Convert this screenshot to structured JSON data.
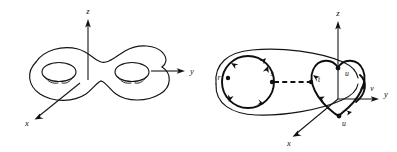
{
  "figure": {
    "background_color": "#ffffff",
    "ink_color": "#111111",
    "panels": [
      {
        "id": "left-panel",
        "name": "double-torus-diagram",
        "shape": "genus-2 surface (double torus)",
        "axes": [
          {
            "id": "z",
            "label": "z",
            "direction": "up",
            "label_x": 88,
            "label_y": 14
          },
          {
            "id": "y",
            "label": "y",
            "direction": "right",
            "label_x": 192,
            "label_y": 71
          },
          {
            "id": "x",
            "label": "x",
            "direction": "down-left",
            "label_x": 27,
            "label_y": 124
          }
        ],
        "holes": 2,
        "curve_labels": []
      },
      {
        "id": "right-panel",
        "name": "handle-diagram",
        "shape": "curved tube / handle with pinched right cross-section",
        "axes": [
          {
            "id": "z",
            "label": "z",
            "direction": "up",
            "label_x": 338,
            "label_y": 16
          },
          {
            "id": "y",
            "label": "y",
            "direction": "right",
            "label_x": 386,
            "label_y": 94
          },
          {
            "id": "x",
            "label": "x",
            "direction": "down-left",
            "label_x": 289,
            "label_y": 143
          }
        ],
        "curve_labels": [
          {
            "id": "r",
            "label": "r",
            "x": 221,
            "y": 78,
            "description": "left circular cross-section point"
          },
          {
            "id": "s",
            "label": "s",
            "x": 272,
            "y": 74,
            "description": "left end of dashed core segment"
          },
          {
            "id": "t",
            "label": "t",
            "x": 318,
            "y": 79,
            "description": "right end of dashed core segment"
          },
          {
            "id": "u_top",
            "label": "u",
            "x": 347,
            "y": 73,
            "description": "upper pinch point of right cross-section"
          },
          {
            "id": "u_bottom",
            "label": "u",
            "x": 344,
            "y": 121,
            "description": "lower pinch point of right cross-section"
          },
          {
            "id": "v",
            "label": "v",
            "x": 371,
            "y": 89,
            "description": "right outer loop"
          }
        ],
        "dashed_segment": {
          "from": "s",
          "to": "t"
        }
      }
    ]
  }
}
